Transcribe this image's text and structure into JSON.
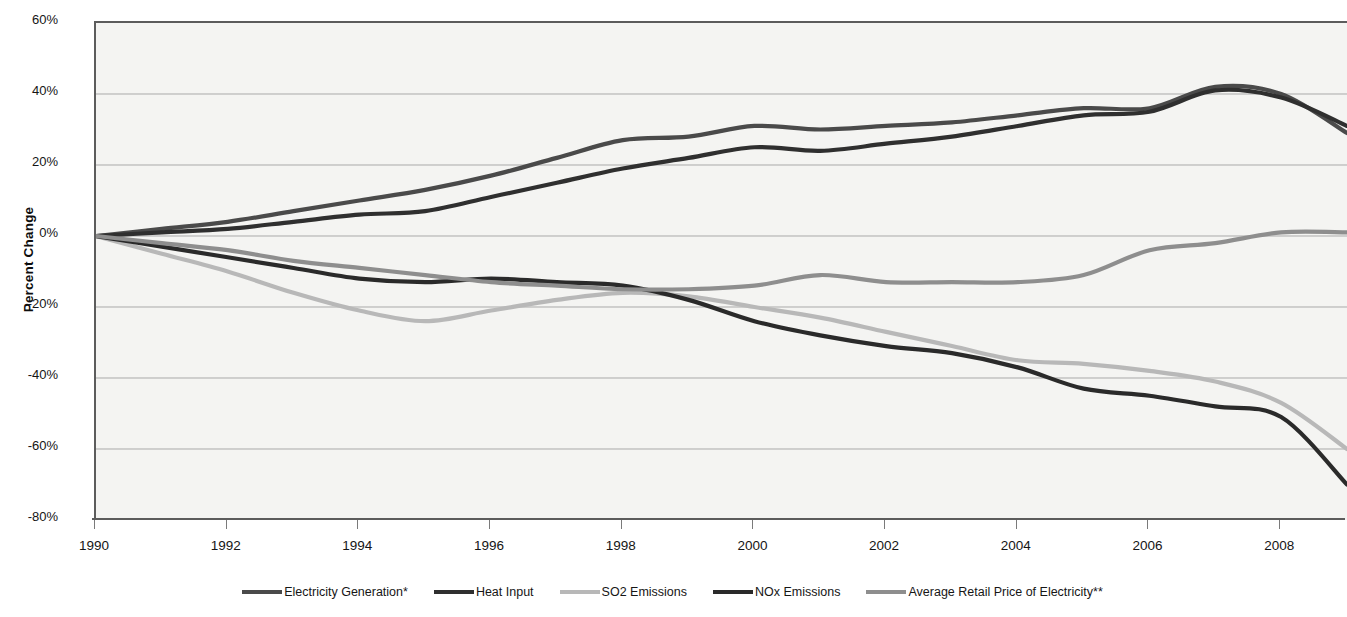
{
  "chart_data": {
    "type": "line",
    "title": "",
    "xlabel": "",
    "ylabel": "Percent Change",
    "xlim": [
      1990,
      2009
    ],
    "ylim": [
      -80,
      60
    ],
    "ytick_labels": [
      "60%",
      "40%",
      "20%",
      "0%",
      "-20%",
      "-40%",
      "-60%",
      "-80%"
    ],
    "ytick_values": [
      60,
      40,
      20,
      0,
      -20,
      -40,
      -60,
      -80
    ],
    "xtick_labels": [
      "1990",
      "1992",
      "1994",
      "1996",
      "1998",
      "2000",
      "2002",
      "2004",
      "2006",
      "2008"
    ],
    "xtick_values": [
      1990,
      1992,
      1994,
      1996,
      1998,
      2000,
      2002,
      2004,
      2006,
      2008
    ],
    "grid": "horizontal",
    "legend_position": "bottom",
    "x": [
      1990,
      1991,
      1992,
      1993,
      1994,
      1995,
      1996,
      1997,
      1998,
      1999,
      2000,
      2001,
      2002,
      2003,
      2004,
      2005,
      2006,
      2007,
      2008,
      2009
    ],
    "series": [
      {
        "name": "Electricity Generation*",
        "color": "#4a4a4a",
        "values": [
          0,
          2,
          4,
          7,
          10,
          13,
          17,
          22,
          27,
          28,
          31,
          30,
          31,
          32,
          34,
          36,
          36,
          42,
          40,
          29
        ]
      },
      {
        "name": "Heat Input",
        "color": "#2f2f2f",
        "values": [
          0,
          1,
          2,
          4,
          6,
          7,
          11,
          15,
          19,
          22,
          25,
          24,
          26,
          28,
          31,
          34,
          35,
          41,
          39,
          31
        ]
      },
      {
        "name": "SO2 Emissions",
        "color": "#b8b8b8",
        "values": [
          0,
          -5,
          -10,
          -16,
          -21,
          -24,
          -21,
          -18,
          -16,
          -17,
          -20,
          -23,
          -27,
          -31,
          -35,
          -36,
          -38,
          -41,
          -47,
          -60
        ]
      },
      {
        "name": "NOx Emissions",
        "color": "#2a2a2a",
        "values": [
          0,
          -3,
          -6,
          -9,
          -12,
          -13,
          -12,
          -13,
          -14,
          -18,
          -24,
          -28,
          -31,
          -33,
          -37,
          -43,
          -45,
          -48,
          -51,
          -70
        ]
      },
      {
        "name": "Average Retail Price of Electricity**",
        "color": "#8e8e8e",
        "values": [
          0,
          -2,
          -4,
          -7,
          -9,
          -11,
          -13,
          -14,
          -15,
          -15,
          -14,
          -11,
          -13,
          -13,
          -13,
          -11,
          -4,
          -2,
          1,
          1
        ]
      }
    ]
  },
  "legend": {
    "items": [
      {
        "label": "Electricity Generation*"
      },
      {
        "label": "Heat Input"
      },
      {
        "label": "SO2 Emissions"
      },
      {
        "label": "NOx Emissions"
      },
      {
        "label": "Average Retail Price of Electricity**"
      }
    ]
  }
}
